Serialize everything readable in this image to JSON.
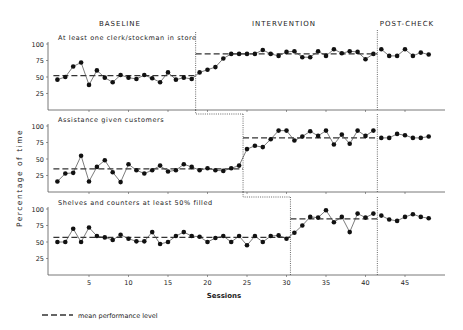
{
  "chart_data": {
    "type": "line",
    "layout": "multiple-baseline, 3 stacked panels sharing x-axis",
    "phases": [
      "BASELINE",
      "INTERVENTION",
      "POST-CHECK"
    ],
    "xlabel": "Sessions",
    "ylabel": "Percentage of time",
    "xticks": [
      5,
      10,
      15,
      20,
      25,
      30,
      35,
      40,
      45
    ],
    "yticks": [
      25,
      50,
      75,
      100
    ],
    "ylim": [
      0,
      100
    ],
    "xlim": [
      0,
      49
    ],
    "legend": "mean performance level",
    "grid": false,
    "panels": [
      {
        "title": "At least one clerk/stockman in store",
        "phase_change_after_session": [
          18.5,
          41.5
        ],
        "baseline_mean": 52,
        "intervention_mean": 85,
        "sessions": [
          1,
          2,
          3,
          4,
          5,
          6,
          7,
          8,
          9,
          10,
          11,
          12,
          13,
          14,
          15,
          16,
          17,
          18,
          19,
          20,
          21,
          22,
          23,
          24,
          25,
          26,
          27,
          28,
          29,
          30,
          31,
          32,
          33,
          34,
          35,
          36,
          37,
          38,
          39,
          40,
          41,
          42,
          43,
          44,
          45,
          46,
          47,
          48
        ],
        "values": [
          46,
          50,
          66,
          72,
          38,
          60,
          49,
          42,
          53,
          49,
          47,
          53,
          48,
          42,
          57,
          46,
          49,
          47,
          57,
          61,
          65,
          78,
          85,
          85,
          85,
          85,
          91,
          85,
          82,
          88,
          89,
          80,
          80,
          89,
          82,
          92,
          86,
          89,
          88,
          77,
          85,
          92,
          82,
          82,
          92,
          82,
          87,
          84
        ]
      },
      {
        "title": "Assistance given customers",
        "phase_change_after_session": [
          24.5,
          41.5
        ],
        "baseline_mean": 35,
        "intervention_mean": 82,
        "sessions": [
          1,
          2,
          3,
          4,
          5,
          6,
          7,
          8,
          9,
          10,
          11,
          12,
          13,
          14,
          15,
          16,
          17,
          18,
          19,
          20,
          21,
          22,
          23,
          24,
          25,
          26,
          27,
          28,
          29,
          30,
          31,
          32,
          33,
          34,
          35,
          36,
          37,
          38,
          39,
          40,
          41,
          42,
          43,
          44,
          45,
          46,
          47,
          48
        ],
        "values": [
          16,
          28,
          29,
          55,
          16,
          38,
          48,
          30,
          15,
          42,
          33,
          28,
          33,
          40,
          31,
          33,
          42,
          38,
          33,
          36,
          33,
          32,
          36,
          40,
          65,
          70,
          68,
          80,
          93,
          93,
          78,
          84,
          92,
          85,
          93,
          72,
          87,
          73,
          93,
          85,
          93,
          82,
          82,
          88,
          86,
          82,
          82,
          84
        ]
      },
      {
        "title": "Shelves and counters at least 50% filled",
        "phase_change_after_session": [
          30.5,
          41.5
        ],
        "baseline_mean": 57,
        "intervention_mean": 85,
        "sessions": [
          1,
          2,
          3,
          4,
          5,
          6,
          7,
          8,
          9,
          10,
          11,
          12,
          13,
          14,
          15,
          16,
          17,
          18,
          19,
          20,
          21,
          22,
          23,
          24,
          25,
          26,
          27,
          28,
          29,
          30,
          31,
          32,
          33,
          34,
          35,
          36,
          37,
          38,
          39,
          40,
          41,
          42,
          43,
          44,
          45,
          46,
          47,
          48
        ],
        "values": [
          50,
          50,
          70,
          50,
          72,
          59,
          57,
          53,
          61,
          55,
          51,
          51,
          65,
          47,
          50,
          59,
          65,
          59,
          58,
          50,
          56,
          59,
          50,
          59,
          45,
          59,
          50,
          59,
          60,
          55,
          64,
          75,
          88,
          87,
          98,
          80,
          88,
          65,
          93,
          87,
          93,
          90,
          84,
          82,
          88,
          92,
          88,
          86
        ]
      }
    ]
  },
  "caption": {
    "legend_label": "mean performance level"
  }
}
